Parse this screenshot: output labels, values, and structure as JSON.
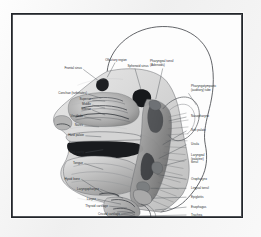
{
  "figure": {
    "kind": "anatomical-illustration",
    "style": "grayscale medical illustration",
    "frame_color": "#23262b",
    "page_background": "#f2f2f2",
    "plate_background": "#fdfdfd",
    "label_color": "#2a2d31",
    "leader_color": "#4a4d52"
  },
  "labels": {
    "left": [
      {
        "id": "frontal-sinus",
        "text": "Frontal sinus"
      },
      {
        "id": "conchae-turbinates",
        "text": "Conchae (turbinates)"
      },
      {
        "id": "concha-superior",
        "text": "Superior"
      },
      {
        "id": "concha-middle",
        "text": "Middle"
      },
      {
        "id": "concha-inferior",
        "text": "Inferior"
      },
      {
        "id": "vestibule",
        "text": "Vestibule"
      },
      {
        "id": "nares",
        "text": "Nares"
      },
      {
        "id": "hard-palate",
        "text": "Hard palate"
      },
      {
        "id": "oral-cavity",
        "text": "Oral cavity"
      },
      {
        "id": "tongue",
        "text": "Tongue"
      },
      {
        "id": "hyoid-bone",
        "text": "Hyoid bone"
      },
      {
        "id": "laryngopharynx",
        "text": "Laryngopharynx"
      },
      {
        "id": "larynx",
        "text": "Larynx"
      },
      {
        "id": "thyroid-cartilage",
        "text": "Thyroid cartilage"
      },
      {
        "id": "cricoid-cartilage",
        "text": "Cricoid cartilage"
      }
    ],
    "top": [
      {
        "id": "olfactory-region",
        "text": "Olfactory region"
      },
      {
        "id": "sphenoid-sinus",
        "text": "Sphenoid sinus"
      },
      {
        "id": "pharyngeal-tonsil",
        "text": "Pharyngeal tonsil\n(Adenoids)"
      }
    ],
    "right": [
      {
        "id": "pharyngotympanic-tube",
        "text": "Pharyngotympanic\n(auditory) tube"
      },
      {
        "id": "nasopharynx",
        "text": "Nasopharynx"
      },
      {
        "id": "soft-palate",
        "text": "Soft palate"
      },
      {
        "id": "uvula",
        "text": "Uvula"
      },
      {
        "id": "laryngeal-tonsil",
        "text": "Laryngeal\n(palatine)\ntonsil"
      },
      {
        "id": "oropharynx",
        "text": "Oropharynx"
      },
      {
        "id": "lingual-tonsil",
        "text": "Lingual tonsil"
      },
      {
        "id": "epiglottis",
        "text": "Epiglottis"
      },
      {
        "id": "esophagus",
        "text": "Esophagus"
      },
      {
        "id": "trachea",
        "text": "Trachea"
      }
    ]
  }
}
